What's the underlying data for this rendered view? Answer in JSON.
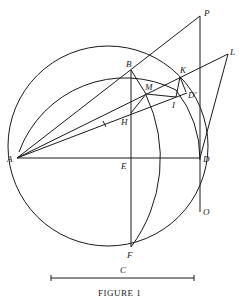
{
  "figure": {
    "caption": "FIGURE 1",
    "scale_label": "C",
    "points": {
      "A": "A",
      "B": "B",
      "D": "D",
      "E": "E",
      "F": "F",
      "H": "H",
      "M": "M",
      "I": "I",
      "K": "K",
      "D_prime": "D'",
      "P": "P",
      "L": "L",
      "O": "O"
    }
  }
}
